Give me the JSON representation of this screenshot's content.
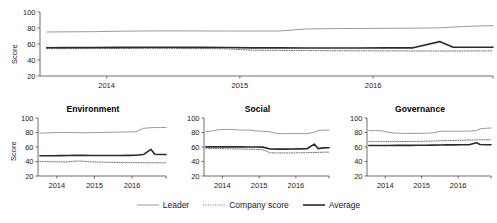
{
  "axis_label": "Score",
  "legend": {
    "items": [
      {
        "label": "Leader",
        "style": "solid",
        "color": "#9a9a9a",
        "width": 1
      },
      {
        "label": "Company score",
        "style": "dotted",
        "color": "#6e6e6e",
        "width": 1
      },
      {
        "label": "Average",
        "style": "solid",
        "color": "#2b2b2b",
        "width": 1.6
      }
    ]
  },
  "chart_data": [
    {
      "type": "line",
      "title": "",
      "panel": "overall",
      "xlabel": "",
      "ylabel": "Score",
      "ylim": [
        20,
        100
      ],
      "yticks": [
        20,
        40,
        60,
        80,
        100
      ],
      "ytick_labels": [
        "20",
        "40",
        "60",
        "80",
        "100"
      ],
      "xlim": [
        2013.5,
        2016.9
      ],
      "xticks": [
        2014,
        2015,
        2016
      ],
      "xtick_labels": [
        "2014",
        "2015",
        "2016"
      ],
      "grid": false,
      "legend_position": "bottom",
      "x": [
        2013.55,
        2013.7,
        2013.9,
        2014.1,
        2014.3,
        2014.5,
        2014.7,
        2014.9,
        2015.1,
        2015.3,
        2015.5,
        2015.7,
        2015.9,
        2016.1,
        2016.3,
        2016.5,
        2016.6,
        2016.75,
        2016.9
      ],
      "series": [
        {
          "name": "Leader",
          "values": [
            75.0,
            75.2,
            75.4,
            76.0,
            76.3,
            76.4,
            76.3,
            76.2,
            76.2,
            76.3,
            78.8,
            79.2,
            79.4,
            79.6,
            79.8,
            80.2,
            81.2,
            82.3,
            83.0
          ]
        },
        {
          "name": "Company score",
          "values": [
            54.2,
            54.2,
            54.3,
            54.4,
            54.5,
            54.4,
            54.2,
            54.0,
            52.2,
            52.0,
            51.8,
            51.6,
            51.5,
            51.4,
            51.3,
            51.2,
            51.2,
            51.3,
            51.4
          ]
        },
        {
          "name": "Average",
          "values": [
            55.4,
            55.5,
            55.6,
            55.8,
            56.0,
            55.9,
            55.8,
            55.7,
            55.2,
            55.1,
            55.0,
            55.0,
            55.0,
            55.1,
            55.2,
            63.0,
            56.0,
            55.9,
            56.0
          ]
        }
      ]
    },
    {
      "type": "line",
      "title": "Environment",
      "panel": "environment",
      "xlabel": "",
      "ylabel": "Score",
      "ylim": [
        20,
        100
      ],
      "yticks": [
        20,
        40,
        60,
        80,
        100
      ],
      "ytick_labels": [
        "20",
        "40",
        "60",
        "80",
        "100"
      ],
      "xlim": [
        2013.5,
        2016.9
      ],
      "xticks": [
        2014,
        2015,
        2016
      ],
      "xtick_labels": [
        "2014",
        "2015",
        "2016"
      ],
      "grid": false,
      "legend_position": "bottom",
      "x": [
        2013.55,
        2013.7,
        2013.9,
        2014.1,
        2014.3,
        2014.5,
        2014.7,
        2014.9,
        2015.1,
        2015.3,
        2015.5,
        2015.7,
        2015.9,
        2016.1,
        2016.3,
        2016.5,
        2016.6,
        2016.75,
        2016.9
      ],
      "series": [
        {
          "name": "Leader",
          "values": [
            79.0,
            79.3,
            79.8,
            80.0,
            80.1,
            79.8,
            79.6,
            79.8,
            80.0,
            80.2,
            80.4,
            80.6,
            80.8,
            81.0,
            85.8,
            86.6,
            86.8,
            86.9,
            87.0
          ]
        },
        {
          "name": "Company score",
          "values": [
            40.0,
            39.8,
            39.6,
            39.5,
            39.4,
            40.6,
            40.4,
            39.4,
            39.2,
            39.0,
            38.8,
            38.6,
            38.5,
            38.4,
            38.3,
            38.2,
            38.2,
            38.2,
            38.2
          ]
        },
        {
          "name": "Average",
          "values": [
            48.0,
            48.0,
            48.0,
            48.1,
            48.2,
            48.4,
            48.4,
            48.3,
            48.2,
            48.2,
            48.2,
            48.3,
            48.4,
            48.6,
            49.6,
            56.8,
            50.0,
            49.6,
            49.6
          ]
        }
      ]
    },
    {
      "type": "line",
      "title": "Social",
      "panel": "social",
      "xlabel": "",
      "ylabel": "",
      "ylim": [
        20,
        100
      ],
      "yticks": [
        20,
        40,
        60,
        80,
        100
      ],
      "ytick_labels": [
        "20",
        "40",
        "60",
        "80",
        "100"
      ],
      "xlim": [
        2013.5,
        2016.9
      ],
      "xticks": [
        2014,
        2015,
        2016
      ],
      "xtick_labels": [
        "2014",
        "2015",
        "2016"
      ],
      "grid": false,
      "legend_position": "bottom",
      "x": [
        2013.55,
        2013.7,
        2013.9,
        2014.1,
        2014.3,
        2014.5,
        2014.7,
        2014.9,
        2015.1,
        2015.3,
        2015.5,
        2015.7,
        2015.9,
        2016.1,
        2016.3,
        2016.5,
        2016.6,
        2016.75,
        2016.9
      ],
      "series": [
        {
          "name": "Leader",
          "values": [
            81.0,
            82.0,
            84.0,
            84.2,
            84.2,
            83.2,
            83.4,
            82.4,
            81.6,
            81.0,
            78.4,
            78.4,
            78.6,
            78.6,
            78.4,
            80.4,
            82.8,
            83.2,
            83.4
          ]
        },
        {
          "name": "Company score",
          "values": [
            58.2,
            58.0,
            57.8,
            57.6,
            57.4,
            57.2,
            57.0,
            56.8,
            56.2,
            52.0,
            51.8,
            51.8,
            51.8,
            52.0,
            52.2,
            52.4,
            52.6,
            52.8,
            53.0
          ]
        },
        {
          "name": "Average",
          "values": [
            60.2,
            60.2,
            60.2,
            60.2,
            60.2,
            60.2,
            60.0,
            60.0,
            59.8,
            57.2,
            57.0,
            57.0,
            57.2,
            57.4,
            57.6,
            64.0,
            57.8,
            58.8,
            59.0
          ]
        }
      ]
    },
    {
      "type": "line",
      "title": "Governance",
      "panel": "governance",
      "xlabel": "",
      "ylabel": "",
      "ylim": [
        20,
        100
      ],
      "yticks": [
        20,
        40,
        60,
        80,
        100
      ],
      "ytick_labels": [
        "20",
        "40",
        "60",
        "80",
        "100"
      ],
      "xlim": [
        2013.5,
        2016.9
      ],
      "xticks": [
        2014,
        2015,
        2016
      ],
      "xtick_labels": [
        "2014",
        "2015",
        "2016"
      ],
      "grid": false,
      "legend_position": "bottom",
      "x": [
        2013.55,
        2013.7,
        2013.9,
        2014.1,
        2014.3,
        2014.5,
        2014.7,
        2014.9,
        2015.1,
        2015.3,
        2015.5,
        2015.7,
        2015.9,
        2016.1,
        2016.3,
        2016.5,
        2016.6,
        2016.75,
        2016.9
      ],
      "series": [
        {
          "name": "Leader",
          "values": [
            82.6,
            82.6,
            82.4,
            80.2,
            79.0,
            78.8,
            78.8,
            78.8,
            79.0,
            79.4,
            81.6,
            81.8,
            81.8,
            81.8,
            82.0,
            82.6,
            85.0,
            85.8,
            86.2
          ]
        },
        {
          "name": "Company score",
          "values": [
            67.4,
            67.4,
            67.4,
            67.4,
            67.5,
            67.6,
            67.6,
            67.8,
            68.0,
            68.2,
            68.6,
            68.8,
            69.0,
            69.2,
            69.6,
            69.8,
            70.0,
            70.0,
            70.0
          ]
        },
        {
          "name": "Average",
          "values": [
            62.0,
            62.0,
            62.0,
            62.1,
            62.2,
            62.3,
            62.3,
            62.4,
            62.5,
            62.6,
            62.8,
            62.9,
            63.0,
            63.1,
            63.2,
            66.0,
            63.4,
            63.2,
            63.2
          ]
        }
      ]
    }
  ]
}
